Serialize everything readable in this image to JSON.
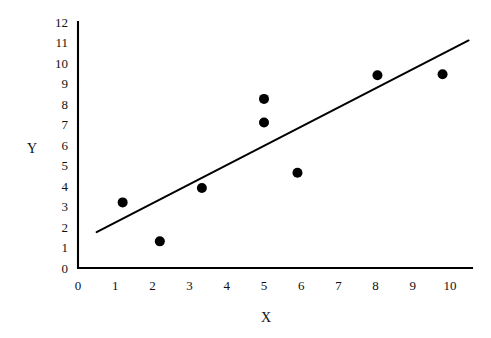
{
  "chart_data": {
    "type": "scatter",
    "title": "",
    "xlabel": "X",
    "ylabel": "Y",
    "xlim": [
      0,
      10
    ],
    "ylim": [
      0,
      12
    ],
    "grid": false,
    "legend": null,
    "x_ticks": [
      "0",
      "1",
      "2",
      "3",
      "4",
      "5",
      "6",
      "7",
      "8",
      "9",
      "10"
    ],
    "y_ticks": [
      "0",
      "1",
      "2",
      "3",
      "4",
      "5",
      "6",
      "7",
      "8",
      "9",
      "10",
      "11",
      "12"
    ],
    "points": [
      {
        "x": 1.2,
        "y": 3.2
      },
      {
        "x": 2.2,
        "y": 1.3
      },
      {
        "x": 3.33,
        "y": 3.9
      },
      {
        "x": 5.0,
        "y": 8.25
      },
      {
        "x": 5.0,
        "y": 7.1
      },
      {
        "x": 5.9,
        "y": 4.65
      },
      {
        "x": 8.05,
        "y": 9.4
      },
      {
        "x": 9.8,
        "y": 9.45
      }
    ],
    "series": [
      {
        "name": "observations",
        "type": "scatter",
        "marker": "filled-circle",
        "marker_size": 5,
        "color": "#000000",
        "x": [
          1.2,
          2.2,
          3.33,
          5.0,
          5.0,
          5.9,
          8.05,
          9.8
        ],
        "values": [
          3.2,
          1.3,
          3.9,
          8.25,
          7.1,
          4.65,
          9.4,
          9.45
        ]
      },
      {
        "name": "trend-line",
        "type": "line",
        "color": "#000000",
        "x": [
          0.5,
          10.5
        ],
        "values": [
          1.75,
          11.1
        ]
      }
    ],
    "colors": {
      "point": "#000000",
      "line": "#000000",
      "axis": "#000000",
      "background": "#ffffff",
      "text": "#111111"
    }
  }
}
